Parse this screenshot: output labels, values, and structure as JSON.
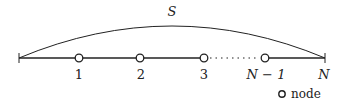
{
  "diagram": {
    "arc_label": "S",
    "nodes": [
      {
        "label": "1",
        "x": 79
      },
      {
        "label": "2",
        "x": 140
      },
      {
        "label": "3",
        "x": 204
      },
      {
        "label": "N − 1",
        "x": 265
      }
    ],
    "end_label": "N",
    "legend": {
      "label": "node",
      "icon": "circle-node-icon"
    },
    "colors": {
      "line": "#222222",
      "node_fill": "#ffffff"
    }
  }
}
